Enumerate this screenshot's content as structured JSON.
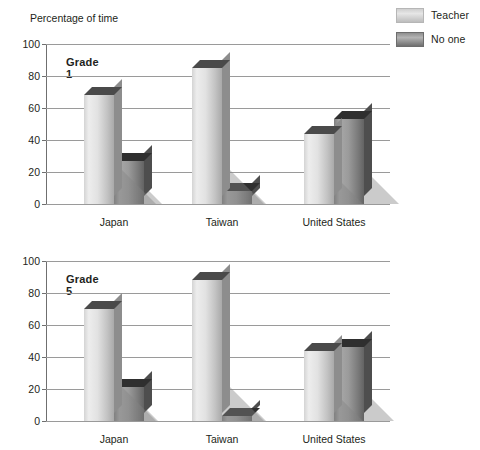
{
  "axis_title": "Percentage of time",
  "legend": {
    "position": "top-right",
    "items": [
      {
        "label": "Teacher",
        "color": "#e2e2e2",
        "swatch": "teacher"
      },
      {
        "label": "No one",
        "color": "#9b9b9b",
        "swatch": "noone"
      }
    ]
  },
  "panels": [
    {
      "id": "grade1",
      "title": "Grade 1"
    },
    {
      "id": "grade5",
      "title": "Grade 5"
    }
  ],
  "y_ticks": [
    "0",
    "20",
    "40",
    "60",
    "80",
    "100"
  ],
  "categories": [
    "Japan",
    "Taiwan",
    "United States"
  ],
  "chart_data": [
    {
      "type": "bar",
      "title": "Grade 1",
      "subtitle": "",
      "xlabel": "",
      "ylabel": "Percentage of time",
      "ylim": [
        0,
        100
      ],
      "yticks": [
        0,
        20,
        40,
        60,
        80,
        100
      ],
      "grid": true,
      "legend_position": "top-right",
      "categories": [
        "Japan",
        "Taiwan",
        "United States"
      ],
      "series": [
        {
          "name": "Teacher",
          "values": [
            68,
            85,
            44
          ]
        },
        {
          "name": "No one",
          "values": [
            27,
            8,
            53
          ]
        }
      ]
    },
    {
      "type": "bar",
      "title": "Grade 5",
      "subtitle": "",
      "xlabel": "",
      "ylabel": "Percentage of time",
      "ylim": [
        0,
        100
      ],
      "yticks": [
        0,
        20,
        40,
        60,
        80,
        100
      ],
      "grid": true,
      "legend_position": "top-right",
      "categories": [
        "Japan",
        "Taiwan",
        "United States"
      ],
      "series": [
        {
          "name": "Teacher",
          "values": [
            70,
            88,
            44
          ]
        },
        {
          "name": "No one",
          "values": [
            21,
            3,
            46
          ]
        }
      ]
    }
  ]
}
